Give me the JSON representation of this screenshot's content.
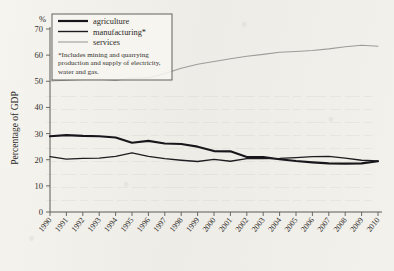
{
  "figure": {
    "y_axis_title": "Percentage of GDP",
    "percent_symbol": "%"
  },
  "legend": {
    "items": [
      {
        "label": "agriculture",
        "color": "#17161a",
        "width": 2.2
      },
      {
        "label": "manufacturing*",
        "color": "#1d1c20",
        "width": 1.4
      },
      {
        "label": "services",
        "color": "#9d9c9a",
        "width": 1.1
      }
    ],
    "note_lines": [
      "*Includes mining and quarrying",
      "production and supply of electricity,",
      "water and gas."
    ]
  },
  "chart_data": {
    "type": "line",
    "title": "",
    "xlabel": "",
    "ylabel": "Percentage of GDP",
    "ylim": [
      0,
      70
    ],
    "yticks": [
      0,
      10,
      20,
      30,
      40,
      50,
      60,
      70
    ],
    "grid": false,
    "legend_position": "top-left",
    "categories": [
      "1990",
      "1991",
      "1992",
      "1993",
      "1994",
      "1995",
      "1996",
      "1997",
      "1998",
      "1999",
      "2000",
      "2001",
      "2002",
      "2003",
      "2004",
      "2005",
      "2006",
      "2007",
      "2008",
      "2009",
      "2010"
    ],
    "series": [
      {
        "name": "agriculture",
        "color": "#17161a",
        "values": [
          29.0,
          29.4,
          29.1,
          29.0,
          28.5,
          26.5,
          27.2,
          26.2,
          26.0,
          25.0,
          23.3,
          23.2,
          21.0,
          21.0,
          20.2,
          19.5,
          19.0,
          18.6,
          18.5,
          18.6,
          19.4
        ]
      },
      {
        "name": "manufacturing*",
        "color": "#1d1c20",
        "values": [
          21.2,
          20.2,
          20.5,
          20.6,
          21.3,
          22.6,
          21.3,
          20.4,
          19.8,
          19.3,
          20.1,
          19.4,
          20.4,
          20.4,
          20.5,
          20.8,
          21.2,
          21.3,
          20.6,
          19.8,
          19.5
        ]
      },
      {
        "name": "services",
        "color": "#9d9c9a",
        "values": [
          50.1,
          50.4,
          50.7,
          50.8,
          50.4,
          51.2,
          51.3,
          53.0,
          55.0,
          56.5,
          57.6,
          58.6,
          59.6,
          60.3,
          61.1,
          61.4,
          61.8,
          62.4,
          63.2,
          63.8,
          63.4
        ]
      }
    ]
  }
}
